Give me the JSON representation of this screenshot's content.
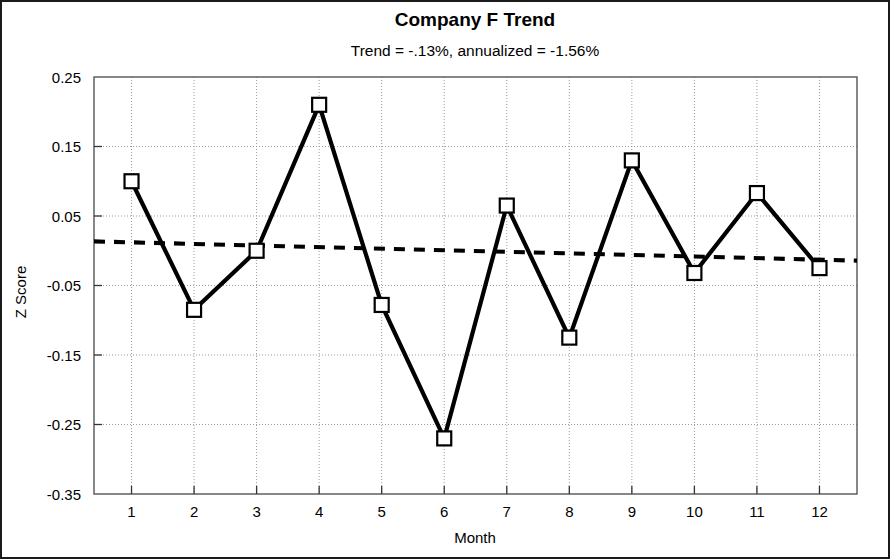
{
  "chart_data": {
    "type": "line",
    "title": "Company F Trend",
    "subtitle": "Trend = -.13%, annualized = -1.56%",
    "xlabel": "Month",
    "ylabel": "Z Score",
    "x": [
      1,
      2,
      3,
      4,
      5,
      6,
      7,
      8,
      9,
      10,
      11,
      12
    ],
    "xtick_labels": [
      "1",
      "2",
      "3",
      "4",
      "5",
      "6",
      "7",
      "8",
      "9",
      "10",
      "11",
      "12"
    ],
    "ytick_labels": [
      "0.25",
      "0.15",
      "0.05",
      "-0.05",
      "-0.15",
      "-0.25",
      "-0.35"
    ],
    "ytick_values": [
      0.25,
      0.15,
      0.05,
      -0.05,
      -0.15,
      -0.25,
      -0.35
    ],
    "xlim": [
      0.4,
      12.6
    ],
    "ylim": [
      -0.35,
      0.25
    ],
    "grid": true,
    "legend": false,
    "series": [
      {
        "name": "Z Score",
        "style": "solid-line-square-markers",
        "color": "#000000",
        "values": [
          0.1,
          -0.085,
          0.0,
          0.21,
          -0.078,
          -0.27,
          0.065,
          -0.125,
          0.13,
          -0.032,
          0.083,
          -0.025
        ]
      },
      {
        "name": "Trend",
        "style": "dotted-line",
        "color": "#000000",
        "values": [
          0.012,
          0.0097,
          0.0075,
          0.0052,
          0.003,
          0.0007,
          -0.0015,
          -0.0038,
          -0.006,
          -0.0083,
          -0.0105,
          -0.0128
        ]
      }
    ]
  }
}
